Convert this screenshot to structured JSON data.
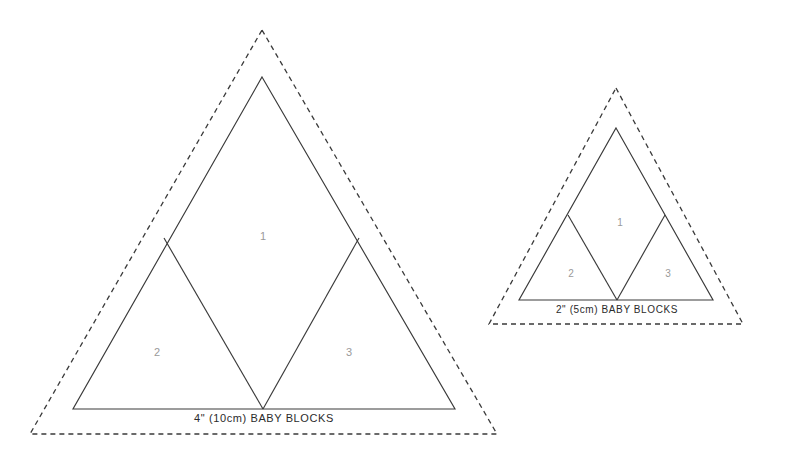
{
  "page": {
    "background_color": "#ffffff",
    "line_color": "#3a3a3a",
    "dashed_line_color": "#3a3a3a",
    "number_color": "#9a9a9a",
    "label_color": "#2b2b2b",
    "width": 787,
    "height": 458
  },
  "templates": [
    {
      "id": "large",
      "label": "4\" (10cm) BABY BLOCKS",
      "size_inches": "4\"",
      "size_cm": "10cm",
      "pattern_name": "BABY BLOCKS",
      "label_font_size": 11,
      "number_font_size": 11,
      "cut_line": {
        "apex_x": 262,
        "apex_y": 77,
        "left_x": 73,
        "right_x": 455,
        "base_y": 409
      },
      "seam_line": {
        "apex_x": 262,
        "apex_y": 30,
        "left_x": 30,
        "right_x": 497,
        "base_y": 434
      },
      "interior_vertices": {
        "left_mid_x": 164,
        "left_mid_y": 238,
        "right_mid_x": 359,
        "right_mid_y": 238,
        "base_mid_x": 263,
        "base_mid_y": 409
      },
      "label_pos": {
        "x": 264,
        "y": 422
      },
      "pieces": [
        {
          "number": "1",
          "x": 263,
          "y": 236,
          "shape": "diamond-center"
        },
        {
          "number": "2",
          "x": 157,
          "y": 352,
          "shape": "triangle-left"
        },
        {
          "number": "3",
          "x": 349,
          "y": 352,
          "shape": "triangle-right"
        }
      ]
    },
    {
      "id": "small",
      "label": "2\" (5cm) BABY BLOCKS",
      "size_inches": "2\"",
      "size_cm": "5cm",
      "pattern_name": "BABY BLOCKS",
      "label_font_size": 10,
      "number_font_size": 10,
      "cut_line": {
        "apex_x": 616,
        "apex_y": 128,
        "left_x": 519,
        "right_x": 713,
        "base_y": 300
      },
      "seam_line": {
        "apex_x": 616,
        "apex_y": 88,
        "left_x": 489,
        "right_x": 743,
        "base_y": 324
      },
      "interior_vertices": {
        "left_mid_x": 568,
        "left_mid_y": 215,
        "right_mid_x": 665,
        "right_mid_y": 215,
        "base_mid_x": 617,
        "base_mid_y": 300
      },
      "label_pos": {
        "x": 617,
        "y": 313
      },
      "pieces": [
        {
          "number": "1",
          "x": 620,
          "y": 222,
          "shape": "diamond-center"
        },
        {
          "number": "2",
          "x": 571,
          "y": 273,
          "shape": "triangle-left"
        },
        {
          "number": "3",
          "x": 668,
          "y": 273,
          "shape": "triangle-right"
        }
      ]
    }
  ]
}
